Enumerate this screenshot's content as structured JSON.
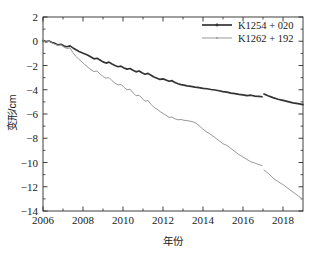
{
  "chart_data": {
    "type": "line",
    "title": "",
    "xlabel": "年份",
    "ylabel": "变形/cm",
    "xlim": [
      2006,
      2019
    ],
    "ylim": [
      -14,
      2
    ],
    "xticks": [
      2006,
      2008,
      2010,
      2012,
      2014,
      2016,
      2018
    ],
    "xtick_labels": [
      "2006",
      "2008",
      "2010",
      "2012",
      "2014",
      "2016",
      "2018"
    ],
    "yticks": [
      2,
      0,
      -2,
      -4,
      -6,
      -8,
      -10,
      -12,
      -14
    ],
    "ytick_labels": [
      "2",
      "0",
      "-2",
      "-4",
      "-6",
      "-8",
      "-10",
      "-12",
      "-14"
    ],
    "minor_ticks": true,
    "grid": false,
    "legend_position": "top-right",
    "series": [
      {
        "name": "K1254 + 020",
        "color": "#333333",
        "marker": "line-with-dot",
        "x": [
          2006.0,
          2006.15,
          2006.3,
          2006.45,
          2006.6,
          2006.75,
          2006.9,
          2007.05,
          2007.2,
          2007.35,
          2007.5,
          2007.65,
          2007.8,
          2007.95,
          2008.1,
          2008.25,
          2008.4,
          2008.55,
          2008.7,
          2008.85,
          2009.0,
          2009.15,
          2009.3,
          2009.45,
          2009.6,
          2009.75,
          2009.9,
          2010.05,
          2010.2,
          2010.35,
          2010.5,
          2010.65,
          2010.8,
          2010.95,
          2011.1,
          2011.25,
          2011.4,
          2011.55,
          2011.7,
          2011.85,
          2012.0,
          2012.15,
          2012.3,
          2012.45,
          2012.6,
          2012.75,
          2012.9,
          2013.05,
          2013.2,
          2013.4,
          2013.6,
          2013.8,
          2014.0,
          2014.2,
          2014.4,
          2014.6,
          2014.8,
          2015.0,
          2015.2,
          2015.4,
          2015.6,
          2015.8,
          2016.0,
          2016.2,
          2016.4,
          2016.6,
          2016.8,
          2016.95
        ],
        "y": [
          0.05,
          -0.05,
          0.02,
          -0.1,
          -0.18,
          -0.3,
          -0.25,
          -0.4,
          -0.45,
          -0.38,
          -0.55,
          -0.7,
          -0.85,
          -0.95,
          -1.05,
          -1.15,
          -1.3,
          -1.45,
          -1.4,
          -1.55,
          -1.7,
          -1.8,
          -1.72,
          -1.88,
          -2.0,
          -2.1,
          -2.05,
          -2.2,
          -2.3,
          -2.25,
          -2.4,
          -2.52,
          -2.45,
          -2.6,
          -2.72,
          -2.65,
          -2.8,
          -2.95,
          -3.05,
          -3.15,
          -3.1,
          -3.2,
          -3.3,
          -3.25,
          -3.4,
          -3.5,
          -3.58,
          -3.62,
          -3.68,
          -3.72,
          -3.78,
          -3.82,
          -3.88,
          -3.92,
          -3.98,
          -4.02,
          -4.08,
          -4.15,
          -4.2,
          -4.28,
          -4.32,
          -4.38,
          -4.42,
          -4.48,
          -4.45,
          -4.52,
          -4.55,
          -4.58
        ]
      },
      {
        "name": "K1254 + 020 (segment 2)",
        "color": "#333333",
        "marker": "line-with-dot",
        "x": [
          2017.05,
          2017.25,
          2017.5,
          2017.75,
          2018.0,
          2018.25,
          2018.5,
          2018.75,
          2019.0
        ],
        "y": [
          -4.35,
          -4.5,
          -4.65,
          -4.78,
          -4.88,
          -4.98,
          -5.08,
          -5.15,
          -5.22
        ]
      },
      {
        "name": "K1262 + 192",
        "color": "#9a9a9a",
        "marker": "line-with-dot",
        "x": [
          2006.0,
          2006.15,
          2006.3,
          2006.45,
          2006.6,
          2006.75,
          2006.9,
          2007.05,
          2007.2,
          2007.35,
          2007.5,
          2007.65,
          2007.8,
          2007.95,
          2008.1,
          2008.25,
          2008.4,
          2008.55,
          2008.7,
          2008.85,
          2009.0,
          2009.15,
          2009.3,
          2009.45,
          2009.6,
          2009.75,
          2009.9,
          2010.05,
          2010.2,
          2010.35,
          2010.5,
          2010.65,
          2010.8,
          2010.95,
          2011.1,
          2011.25,
          2011.4,
          2011.55,
          2011.7,
          2011.85,
          2012.0,
          2012.15,
          2012.3,
          2012.45,
          2012.6,
          2012.75,
          2012.9,
          2013.05,
          2013.2,
          2013.4,
          2013.6,
          2013.8,
          2014.0,
          2014.2,
          2014.4,
          2014.6,
          2014.8,
          2015.0,
          2015.2,
          2015.4,
          2015.6,
          2015.8,
          2016.0,
          2016.2,
          2016.4,
          2016.6,
          2016.8,
          2016.95
        ],
        "y": [
          0.05,
          -0.08,
          0.0,
          -0.15,
          -0.25,
          -0.35,
          -0.3,
          -0.48,
          -0.6,
          -0.55,
          -0.95,
          -1.25,
          -1.5,
          -1.7,
          -1.95,
          -2.15,
          -2.35,
          -2.5,
          -2.45,
          -2.7,
          -2.9,
          -3.05,
          -3.0,
          -3.25,
          -3.45,
          -3.6,
          -3.55,
          -3.8,
          -4.0,
          -3.95,
          -4.25,
          -4.5,
          -4.45,
          -4.7,
          -4.95,
          -4.88,
          -5.2,
          -5.45,
          -5.6,
          -5.8,
          -5.95,
          -6.1,
          -6.28,
          -6.25,
          -6.4,
          -6.48,
          -6.45,
          -6.52,
          -6.55,
          -6.6,
          -6.7,
          -6.95,
          -7.25,
          -7.5,
          -7.7,
          -7.95,
          -8.2,
          -8.45,
          -8.6,
          -8.85,
          -9.1,
          -9.35,
          -9.55,
          -9.75,
          -9.95,
          -10.05,
          -10.18,
          -10.25
        ]
      },
      {
        "name": "K1262 + 192 (segment 2)",
        "color": "#9a9a9a",
        "marker": "line-with-dot",
        "x": [
          2017.05,
          2017.3,
          2017.55,
          2017.8,
          2018.05,
          2018.3,
          2018.55,
          2018.8,
          2019.0
        ],
        "y": [
          -10.62,
          -10.95,
          -11.35,
          -11.62,
          -11.88,
          -12.2,
          -12.5,
          -12.8,
          -13.05
        ]
      }
    ]
  },
  "legend": {
    "entries": [
      {
        "label": "K1254 + 020",
        "color": "#333333"
      },
      {
        "label": "K1262 + 192",
        "color": "#9a9a9a"
      }
    ]
  },
  "axes": {
    "x_title": "年份",
    "y_title": "变形/cm"
  }
}
